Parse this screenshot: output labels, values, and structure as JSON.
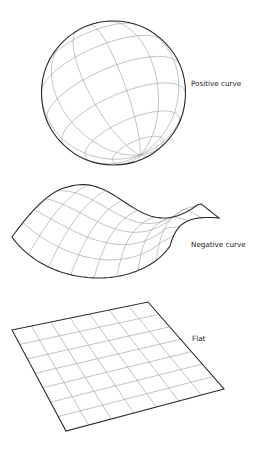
{
  "figure": {
    "panels": [
      {
        "id": "positive",
        "label": "Positive curve",
        "shape": "sphere",
        "label_pos": {
          "x": 191,
          "y": 79
        },
        "sphere": {
          "cx": 113.5,
          "cy": 93,
          "r": 72,
          "pole": {
            "x": 140,
            "y": 155
          },
          "meridians": 12,
          "parallels": 8
        }
      },
      {
        "id": "negative",
        "label": "Negative curve",
        "shape": "saddle",
        "label_pos": {
          "x": 191,
          "y": 240
        },
        "grid": {
          "u": 8,
          "v": 5
        }
      },
      {
        "id": "flat",
        "label": "Flat",
        "shape": "plane",
        "label_pos": {
          "x": 192,
          "y": 334
        },
        "plane": {
          "corners": [
            [
              12,
              330
            ],
            [
              148,
              302
            ],
            [
              224,
              389
            ],
            [
              66,
              431
            ]
          ],
          "cells": 7
        }
      }
    ]
  },
  "colors": {
    "edge": "#2a2a2a",
    "grid": "#9a9a9a",
    "text": "#222222",
    "background": "#ffffff"
  }
}
